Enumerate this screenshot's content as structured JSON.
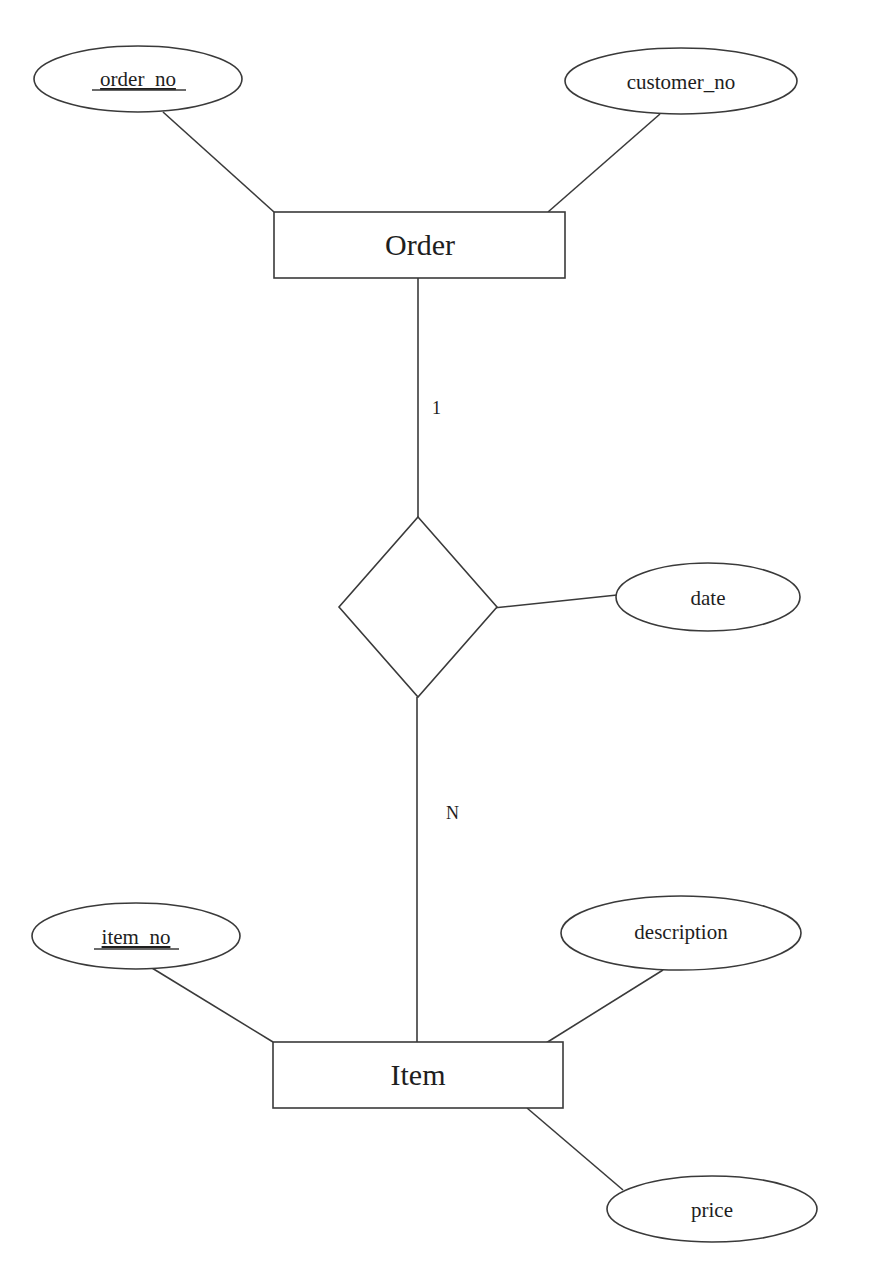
{
  "diagram": {
    "type": "entity-relationship",
    "entities": [
      {
        "id": "order",
        "label": "Order"
      },
      {
        "id": "item",
        "label": "Item"
      }
    ],
    "relationship": {
      "id": "rel",
      "label": "",
      "attributes": [
        "date"
      ]
    },
    "attributes": {
      "order_no": {
        "label": "order_no",
        "key": true,
        "entity": "Order"
      },
      "customer_no": {
        "label": "customer_no",
        "key": false,
        "entity": "Order"
      },
      "date": {
        "label": "date",
        "key": false,
        "entity": "relationship"
      },
      "item_no": {
        "label": "item_no",
        "key": true,
        "entity": "Item"
      },
      "description": {
        "label": "description",
        "key": false,
        "entity": "Item"
      },
      "price": {
        "label": "price",
        "key": false,
        "entity": "Item"
      }
    },
    "cardinality": {
      "order_side": "1",
      "item_side": "N"
    }
  }
}
